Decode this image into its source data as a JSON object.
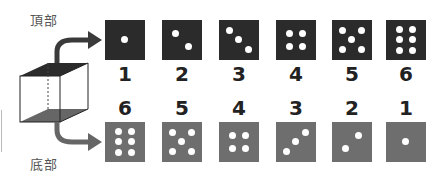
{
  "labels": {
    "top": "頂部",
    "bottom": "底部"
  },
  "colors": {
    "top_face": "#2b2b2b",
    "bottom_face": "#6e6e6e",
    "pip": "#ffffff",
    "arrow": "#3a3a3a",
    "arrow_bottom": "#666666"
  },
  "top_row": {
    "dice": [
      {
        "value": "1"
      },
      {
        "value": "2"
      },
      {
        "value": "3"
      },
      {
        "value": "4"
      },
      {
        "value": "5"
      },
      {
        "value": "6"
      }
    ]
  },
  "bottom_row": {
    "dice": [
      {
        "value": "6"
      },
      {
        "value": "5"
      },
      {
        "value": "4"
      },
      {
        "value": "3"
      },
      {
        "value": "2"
      },
      {
        "value": "1"
      }
    ]
  }
}
